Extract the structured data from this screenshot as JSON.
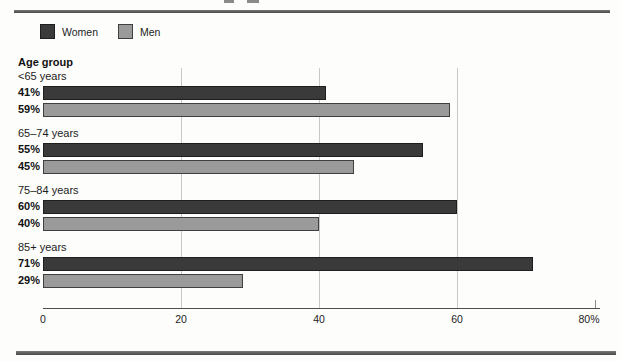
{
  "legend": [
    {
      "label": "Women",
      "color": "#3a3a3a",
      "border": "#1e1e1e"
    },
    {
      "label": "Men",
      "color": "#9a9a9a",
      "border": "#3f3f3f"
    }
  ],
  "chart_data": {
    "type": "bar",
    "orientation": "horizontal",
    "group_axis_label": "Age group",
    "categories": [
      "<65 years",
      "65–74 years",
      "75–84 years",
      "85+ years"
    ],
    "series": [
      {
        "name": "Women",
        "values": [
          41,
          55,
          60,
          71
        ],
        "color": "#3a3a3a",
        "border": "#1e1e1e"
      },
      {
        "name": "Men",
        "values": [
          59,
          45,
          40,
          29
        ],
        "color": "#9a9a9a",
        "border": "#3f3f3f"
      }
    ],
    "value_label_suffix": "%",
    "xlim": [
      0,
      80
    ],
    "x_ticks": [
      {
        "label": "0",
        "value": 0
      },
      {
        "label": "20",
        "value": 20
      },
      {
        "label": "40",
        "value": 40
      },
      {
        "label": "60",
        "value": 60
      },
      {
        "label": "80%",
        "value": 80
      }
    ],
    "gridlines_at": [
      20,
      40,
      60
    ],
    "short_ticks_at": [
      80
    ],
    "legend_position": "top-left",
    "grid": "vertical-only"
  }
}
